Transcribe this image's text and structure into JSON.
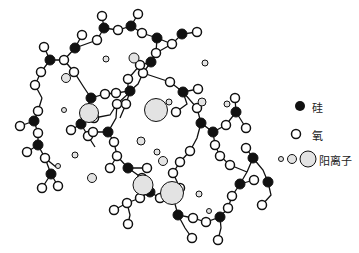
{
  "legend": {
    "silicon": {
      "label": "硅",
      "icon": "filled-black-circle"
    },
    "oxygen": {
      "label": "氧",
      "icon": "open-circle"
    },
    "cation": {
      "label": "阳离子",
      "icon": "dotted-circles-small-medium-large"
    }
  },
  "colors": {
    "silicon": "#111111",
    "oxygen_fill": "#ffffff",
    "stroke": "#111111",
    "cation_fill": "#e6e6e6"
  },
  "structure": {
    "silicon": [
      [
        64,
        60
      ],
      [
        151,
        60
      ],
      [
        177,
        34
      ],
      [
        228,
        41
      ],
      [
        260,
        61
      ],
      [
        304,
        49
      ],
      [
        346,
        45
      ],
      [
        306,
        108
      ],
      [
        383,
        85
      ],
      [
        228,
        72
      ],
      [
        150,
        158
      ],
      [
        176,
        90
      ],
      [
        257,
        110
      ],
      [
        309,
        97
      ],
      [
        273,
        201
      ]
    ],
    "note": "Network of SiO4 tetrahedra enclosing cations (glass structure)"
  }
}
